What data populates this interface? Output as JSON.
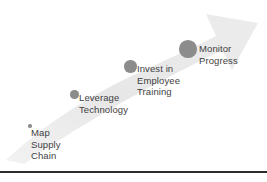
{
  "diagram": {
    "type": "ascending-arrow-milestone",
    "arrow": {
      "name": "upward-trend-arrow",
      "fill_color": "#e9e9e9",
      "direction": "up-right"
    },
    "dot_color": "#8c8c8c",
    "text_color": "#3f3f3f",
    "baseline_color": "#2b2b2b",
    "steps": [
      {
        "id": "map-supply-chain",
        "label": "Map\nSupply\nChain",
        "dot": {
          "x": 28,
          "y": 124,
          "size": 3.5
        },
        "text": {
          "x": 31,
          "y": 127
        }
      },
      {
        "id": "leverage-technology",
        "label": "Leverage\nTechnology",
        "dot": {
          "x": 70,
          "y": 90,
          "size": 8.5
        },
        "text": {
          "x": 79,
          "y": 92
        }
      },
      {
        "id": "invest-in-employee-training",
        "label": "Invest in\nEmployee\nTraining",
        "dot": {
          "x": 124,
          "y": 60,
          "size": 12.5
        },
        "text": {
          "x": 137,
          "y": 63
        }
      },
      {
        "id": "monitor-progress",
        "label": "Monitor\nProgress",
        "dot": {
          "x": 179,
          "y": 40,
          "size": 17.5
        },
        "text": {
          "x": 199,
          "y": 43
        }
      }
    ],
    "baseline": {
      "y": 171,
      "height": 2
    }
  }
}
